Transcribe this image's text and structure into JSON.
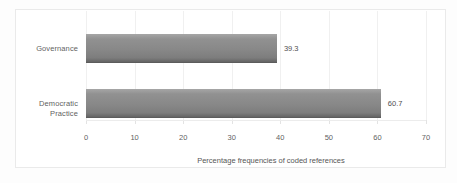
{
  "chart_data": {
    "type": "bar",
    "orientation": "horizontal",
    "categories": [
      "Governance",
      "Democratic Practice"
    ],
    "values": [
      39.3,
      60.7
    ],
    "data_labels": [
      "39.3",
      "60.7"
    ],
    "title": "",
    "xlabel": "Percentage frequencies of coded references",
    "ylabel": "",
    "xlim": [
      0,
      70
    ],
    "xticks": [
      "0",
      "10",
      "20",
      "30",
      "40",
      "50",
      "60",
      "70"
    ],
    "grid": true,
    "legend": "none",
    "colors": {
      "bar": "#888888",
      "bar_edge": "#5c5c5c",
      "text": "#5f5f5f",
      "gridline": "#f0f0f0",
      "chart_border": "#eaeaea",
      "background": "#ffffff"
    }
  }
}
